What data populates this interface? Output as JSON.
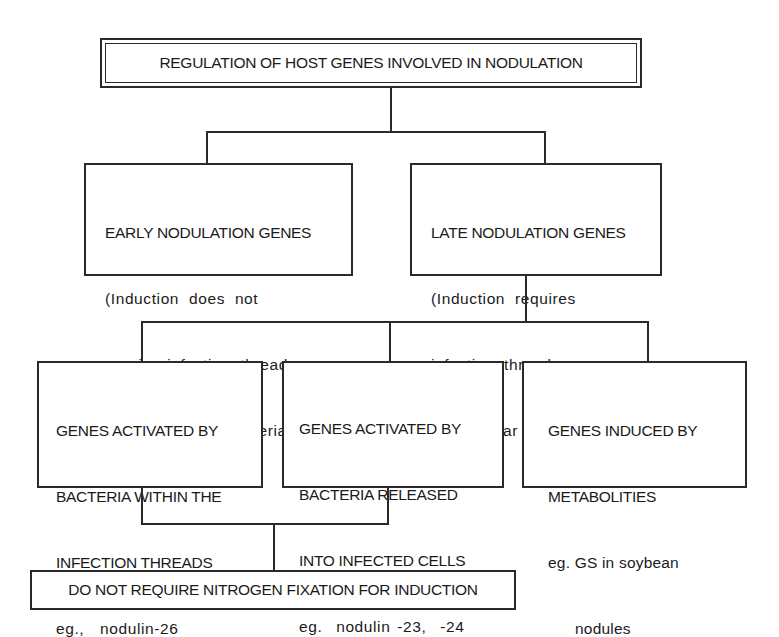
{
  "diagram": {
    "title": "REGULATION OF HOST GENES INVOLVED IN NODULATION",
    "level1": {
      "early": {
        "heading": "EARLY NODULATION GENES",
        "lines": [
          "(Induction does not",
          "require infection thread",
          "or intracellular bacteria)"
        ]
      },
      "late": {
        "heading": "LATE NODULATION GENES",
        "lines": [
          "(Induction requires",
          "infection threads or",
          "intracellular bacteria)"
        ]
      }
    },
    "level2": [
      {
        "lines": [
          "GENES ACTIVATED BY",
          "BACTERIA WITHIN THE",
          "INFECTION THREADS"
        ],
        "example": "eg.,  nodulin-26"
      },
      {
        "lines": [
          "GENES ACTIVATED BY",
          "BACTERIA RELEASED",
          "INTO INFECTED CELLS"
        ],
        "example": "eg.  nodulin -23,  -24"
      },
      {
        "lines": [
          "GENES INDUCED BY",
          "METABOLITIES"
        ],
        "example": "eg. GS in soybean",
        "example2": "      nodules"
      }
    ],
    "level3": "DO NOT REQUIRE NITROGEN FIXATION FOR INDUCTION"
  }
}
